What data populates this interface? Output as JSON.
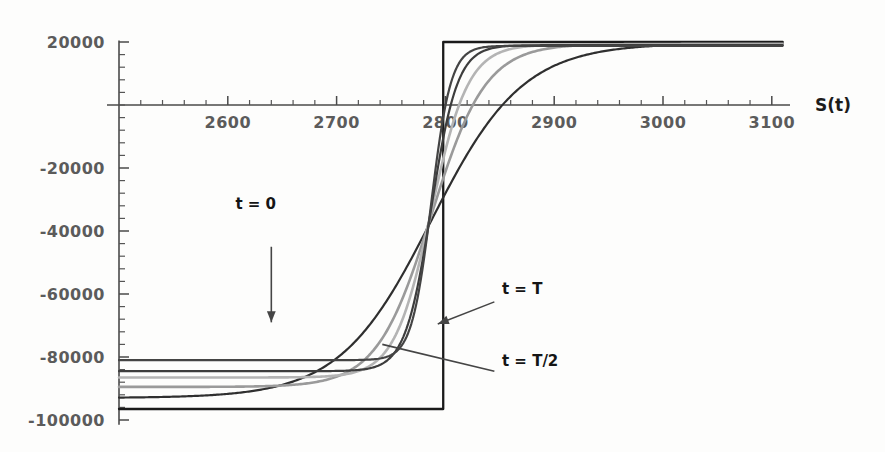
{
  "chart_data": {
    "type": "line",
    "title": "",
    "subtitle": "",
    "xlabel": "S(t)",
    "ylabel": "",
    "xlim": [
      2500,
      3110
    ],
    "ylim": [
      -105000,
      22000
    ],
    "grid": false,
    "legend_position": "annotations-inline",
    "x_ticks": [
      2600,
      2700,
      2800,
      2900,
      3000,
      3100
    ],
    "x_tick_labels": [
      "2600",
      "2700",
      "2800",
      "2900",
      "3000",
      "3100"
    ],
    "x_minor_tick_step": 20,
    "y_ticks": [
      20000,
      0,
      -20000,
      -40000,
      -60000,
      -80000,
      -100000
    ],
    "y_tick_labels": [
      "20000",
      "",
      "-20000",
      "-40000",
      "-60000",
      "-80000",
      "-100000"
    ],
    "y_minor_tick_step": 4000,
    "x_axis_value": 0,
    "y_axis_value": 2500,
    "asymptote_low": -96500,
    "asymptote_high": 20000,
    "crossing_point": {
      "x": 2787,
      "y": -40500
    },
    "series": [
      {
        "name": "t = T",
        "color": "#1a1a1a",
        "width": 2.3,
        "steepness": 400,
        "left_value": -96500,
        "right_value": 20000,
        "description": "payoff step function at maturity"
      },
      {
        "name": "t = T/2 nearest",
        "color": "#2f2f2f",
        "width": 2.2,
        "steepness": 42,
        "left_value": -93000,
        "right_value": 19600,
        "description": "smoothed sigmoid close to maturity"
      },
      {
        "name": "intermediate-light",
        "color": "#9a9a9a",
        "width": 2.6,
        "steepness": 25,
        "left_value": -89500,
        "right_value": 19400,
        "description": "intermediate time sigmoid"
      },
      {
        "name": "intermediate-mid",
        "color": "#b4b4b4",
        "width": 2.6,
        "steepness": 17,
        "left_value": -86500,
        "right_value": 19200,
        "description": "intermediate time sigmoid"
      },
      {
        "name": "t = 0 inner",
        "color": "#3d3d3d",
        "width": 2.2,
        "steepness": 12,
        "left_value": -84500,
        "right_value": 19000,
        "description": "early time sigmoid"
      },
      {
        "name": "t = 0",
        "color": "#444444",
        "width": 2.2,
        "steepness": 9,
        "left_value": -81000,
        "right_value": 18800,
        "description": "flattest curve, value at t = 0"
      }
    ],
    "annotations": [
      {
        "label": "t = 0",
        "label_x": 2607,
        "label_y": -33000,
        "arrow_from_x": 2640,
        "arrow_from_y": -45000,
        "arrow_to_x": 2640,
        "arrow_to_y": -69000,
        "arrow_style": "arrowhead"
      },
      {
        "label": "t = T",
        "label_x": 2852,
        "label_y": -60000,
        "arrow_from_x": 2845,
        "arrow_from_y": -62500,
        "arrow_to_x": 2793,
        "arrow_to_y": -69500,
        "arrow_style": "arrowhead"
      },
      {
        "label": "t = T/2",
        "label_x": 2852,
        "label_y": -83000,
        "arrow_from_x": 2845,
        "arrow_from_y": -84500,
        "arrow_to_x": 2742,
        "arrow_to_y": -76000,
        "arrow_style": "leader"
      }
    ]
  },
  "axis_name_label": "S(t)"
}
